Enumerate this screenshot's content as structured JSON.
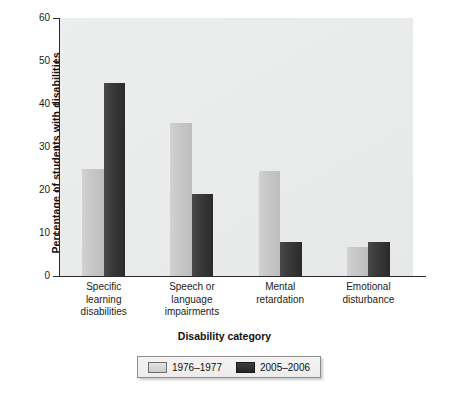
{
  "chart_data": {
    "type": "bar",
    "title": "",
    "xlabel": "Disability category",
    "ylabel": "Percentage of students with disabilities",
    "categories": [
      "Specific learning disabilities",
      "Speech or language impairments",
      "Mental retardation",
      "Emotional disturbance"
    ],
    "category_lines": [
      [
        "Specific",
        "learning",
        "disabilities"
      ],
      [
        "Speech or",
        "language",
        "impairments"
      ],
      [
        "Mental",
        "retardation"
      ],
      [
        "Emotional",
        "disturbance"
      ]
    ],
    "series": [
      {
        "name": "1976–1977",
        "color": "#c8c8c8",
        "values": [
          24.8,
          35.5,
          24.5,
          6.8
        ]
      },
      {
        "name": "2005–2006",
        "color": "#333333",
        "values": [
          45.0,
          19.0,
          8.0,
          7.8
        ]
      }
    ],
    "ylim": [
      0,
      60
    ],
    "yticks": [
      0,
      10,
      20,
      30,
      40,
      50,
      60
    ],
    "ytick_labels": [
      "0",
      "10",
      "20",
      "30",
      "40",
      "50",
      "60"
    ],
    "grid": false,
    "legend_position": "bottom",
    "plot_background": "#eaebeb",
    "axis_color": "#2b2b2b"
  },
  "legend": {
    "entries": [
      {
        "label": "1976–1977",
        "swatch": "light"
      },
      {
        "label": "2005–2006",
        "swatch": "dark"
      }
    ]
  }
}
